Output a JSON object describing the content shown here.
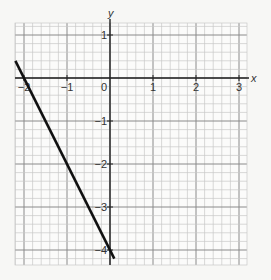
{
  "chart_data": {
    "type": "line",
    "title": "",
    "xlabel": "x",
    "ylabel": "y",
    "xlim": [
      -2.2,
      3.2
    ],
    "ylim": [
      -4.3,
      1.25
    ],
    "grid": true,
    "minor_grid_per_unit": 5,
    "x_ticks": [
      {
        "value": -2,
        "label": "−2"
      },
      {
        "value": -1,
        "label": "−1"
      },
      {
        "value": 0,
        "label": "0"
      },
      {
        "value": 1,
        "label": "1"
      },
      {
        "value": 2,
        "label": "2"
      },
      {
        "value": 3,
        "label": "3"
      }
    ],
    "y_ticks": [
      {
        "value": 1,
        "label": "1"
      },
      {
        "value": -1,
        "label": "−1"
      },
      {
        "value": -2,
        "label": "−2"
      },
      {
        "value": -3,
        "label": "−3"
      },
      {
        "value": -4,
        "label": "−4"
      }
    ],
    "series": [
      {
        "name": "y = -2x - 4",
        "x": [
          -2.2,
          0.1
        ],
        "y": [
          0.4,
          -4.2
        ],
        "color": "#111111"
      }
    ]
  },
  "labels": {
    "x_axis": "x",
    "y_axis": "y"
  }
}
